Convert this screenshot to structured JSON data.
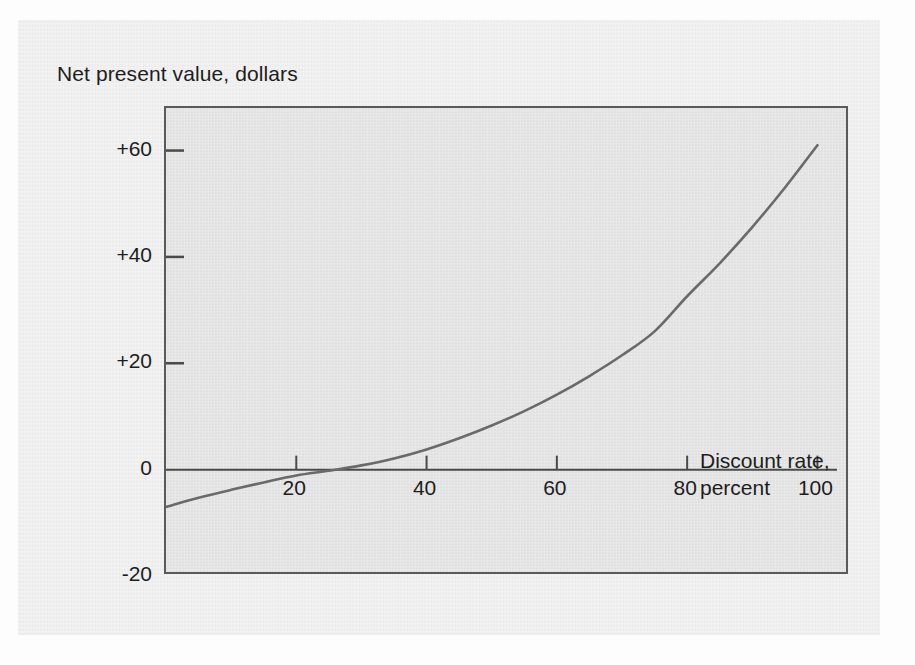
{
  "figure": {
    "background_color": "#ececec",
    "plot_background_color": "#e2e2e2",
    "frame_color": "#5a5a5a",
    "curve_color": "#6a6a6a",
    "text_color": "#1d1d1d"
  },
  "chart_data": {
    "type": "line",
    "title": "",
    "xlabel_line1": "Discount rate,",
    "xlabel_line2": "percent",
    "ylabel": "Net present value, dollars",
    "xlim": [
      0,
      105
    ],
    "ylim": [
      -20,
      68
    ],
    "xticks": [
      20,
      40,
      60,
      80,
      100
    ],
    "xtick_labels": [
      "20",
      "40",
      "60",
      "80",
      "100"
    ],
    "yticks": [
      -20,
      0,
      20,
      40,
      60
    ],
    "ytick_labels": [
      "-20",
      "0",
      "+20",
      "+40",
      "+60"
    ],
    "grid": false,
    "legend": null,
    "zero_line": 0,
    "zero_crossing_x": 26,
    "series": [
      {
        "name": "Net present value",
        "x": [
          0,
          5,
          10,
          15,
          20,
          25,
          30,
          35,
          40,
          45,
          50,
          55,
          60,
          65,
          70,
          75,
          80,
          85,
          90,
          95,
          100
        ],
        "y": [
          -7.0,
          -5.3,
          -3.8,
          -2.4,
          -1.1,
          -0.2,
          0.8,
          2.1,
          3.8,
          5.9,
          8.3,
          11.0,
          14.1,
          17.6,
          21.5,
          26.0,
          32.6,
          38.8,
          45.6,
          53.0,
          61.0
        ]
      }
    ]
  }
}
